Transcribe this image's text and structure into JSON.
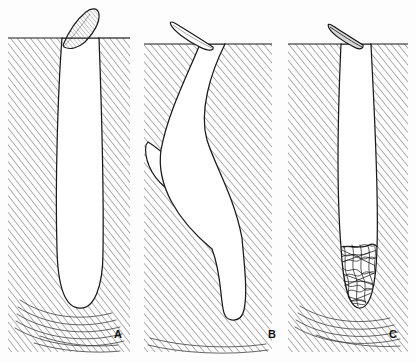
{
  "figure": {
    "kind": "scientific-line-drawing",
    "background_color": "#fdfdfd",
    "ink_color": "#1a1a1a",
    "hatch_color": "#4a4a4a",
    "fill_color": "#ffffff",
    "width": 416,
    "height": 363
  },
  "panels": [
    {
      "id": "A",
      "label": "A",
      "label_x": 118,
      "label_y": 338,
      "surface_y": 38,
      "region_x": 8,
      "region_width": 122,
      "feature": "simple straight burrow with rounded blind end",
      "flap": {
        "name": "surface-flap",
        "style": "hatched leaf-shaped flap angled up-right",
        "points": "62,46 70,30 82,14 92,10 97,14 95,24 86,36 74,46"
      },
      "burrow": {
        "name": "burrow-cavity",
        "outline": "M62,40 C58,90 55,180 57,250 C58,285 66,306 80,307 C94,308 103,287 103,252 C104,180 101,92 99,40 Z"
      },
      "substrate_left": "M8,38 L62,38 C58,90 55,180 57,250 C58,288 66,308 80,308 C94,309 103,287 103,252 C104,180 101,92 99,38 L130,38 L130,352 L8,352 Z"
    },
    {
      "id": "B",
      "label": "B",
      "label_x": 272,
      "label_y": 338,
      "surface_y": 44,
      "region_x": 144,
      "region_width": 128,
      "feature": "curved burrow with elongate tapering side branch",
      "flap": {
        "name": "surface-flap",
        "style": "slender pointed flap angled up-left",
        "points": "212,46 196,34 180,24 175,22 179,28 192,40 203,48"
      },
      "burrow": {
        "name": "burrow-cavity",
        "outline": "M199,44 C186,74 166,112 160,150 C155,184 176,220 212,248 C222,274 220,300 224,312 C227,320 240,320 243,310 C247,292 243,262 241,238 C233,196 214,166 206,140 C198,112 209,74 224,44 Z"
      },
      "branch": {
        "name": "side-branch",
        "outline": "M152,146 C168,158 192,182 212,206 C224,220 234,238 240,250 C243,256 238,258 233,252 C214,230 186,202 166,186 C152,174 146,158 148,148 Z"
      },
      "substrate_left": "M144,44 L199,44 C186,74 166,112 160,150 C155,184 176,220 212,248 C222,274 220,300 224,312 C227,322 240,322 243,310 C247,292 243,262 241,238 C233,196 214,166 206,140 C198,112 209,74 224,44 L272,44 L272,352 L144,352 Z"
    },
    {
      "id": "C",
      "label": "C",
      "label_x": 393,
      "label_y": 338,
      "surface_y": 44,
      "region_x": 288,
      "region_width": 120,
      "feature": "narrow burrow with tangled fibrous mass packed in the lower terminus",
      "flap": {
        "name": "surface-flap",
        "style": "narrow dark slender flap angled up-left",
        "points": "362,44 350,36 336,27 332,25 336,32 348,42 357,47"
      },
      "burrow": {
        "name": "burrow-cavity",
        "outline": "M340,44 C337,110 336,186 340,246 C342,282 348,306 358,307 C370,308 375,284 376,248 C378,186 373,110 370,44 Z"
      },
      "infill": {
        "name": "fibrous-infill-mass",
        "description": "dense tangled scribbled mass occupying the blind terminus"
      },
      "substrate_left": "M288,44 L340,44 C337,110 336,186 340,246 C342,282 348,306 358,307 C370,308 375,284 376,248 C378,186 373,110 370,44 L408,44 L408,352 L288,352 Z"
    }
  ],
  "legend": {
    "hatch_meaning": "sediment / substrate matrix",
    "white_meaning": "open burrow cavity"
  }
}
